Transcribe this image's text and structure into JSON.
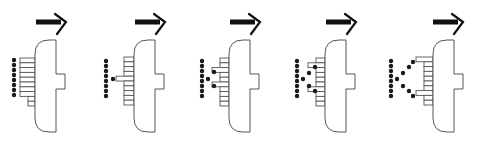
{
  "figure": {
    "colors": {
      "ink": "#111111",
      "outline": "#555555",
      "background": "#ffffff"
    },
    "common": {
      "body": {
        "top": 40,
        "bottom": 132,
        "width": 21,
        "corner_radius": 14,
        "knob": {
          "top": 74,
          "bottom": 89,
          "width": 9
        }
      },
      "arrow": {
        "y": 22,
        "length": 27,
        "shaft_thickness": 5
      },
      "dot_radius": 2.2,
      "rung_height": 4.8
    },
    "panels": [
      {
        "id": 1,
        "label": "I",
        "body_x": 35,
        "arrow_x": 36,
        "rungs": [
          {
            "y": 58,
            "x": 20
          },
          {
            "y": 62.8,
            "x": 20
          },
          {
            "y": 67.6,
            "x": 20
          },
          {
            "y": 72.4,
            "x": 20
          },
          {
            "y": 77.2,
            "x": 20
          },
          {
            "y": 82,
            "x": 20
          },
          {
            "y": 86.8,
            "x": 20
          },
          {
            "y": 91.6,
            "x": 20
          },
          {
            "y": 96.4,
            "x": 28
          },
          {
            "y": 101.2,
            "x": 28
          }
        ],
        "dots": [
          [
            14,
            60
          ],
          [
            14,
            65
          ],
          [
            14,
            70
          ],
          [
            14,
            75
          ],
          [
            14,
            80
          ],
          [
            14,
            85
          ],
          [
            14,
            90
          ],
          [
            14,
            95
          ]
        ]
      },
      {
        "id": 2,
        "label": "I with one branch dot",
        "body_x": 134,
        "arrow_x": 135,
        "rungs": [
          {
            "y": 57,
            "x": 124
          },
          {
            "y": 61.8,
            "x": 124
          },
          {
            "y": 66.6,
            "x": 124
          },
          {
            "y": 71.4,
            "x": 124
          },
          {
            "y": 76.2,
            "x": 116
          },
          {
            "y": 81,
            "x": 124
          },
          {
            "y": 85.8,
            "x": 124
          },
          {
            "y": 90.6,
            "x": 124
          },
          {
            "y": 95.4,
            "x": 124
          },
          {
            "y": 100.2,
            "x": 124
          }
        ],
        "dots": [
          [
            106,
            61
          ],
          [
            106,
            66
          ],
          [
            106,
            71
          ],
          [
            106,
            76
          ],
          [
            106,
            81
          ],
          [
            106,
            86
          ],
          [
            106,
            91
          ],
          [
            106,
            96
          ],
          [
            113,
            79
          ]
        ]
      },
      {
        "id": 3,
        "label": "I with two branch dots",
        "body_x": 229,
        "arrow_x": 230,
        "rungs": [
          {
            "y": 58,
            "x": 220
          },
          {
            "y": 62.8,
            "x": 220
          },
          {
            "y": 67.6,
            "x": 212
          },
          {
            "y": 72.4,
            "x": 220
          },
          {
            "y": 77.2,
            "x": 220
          },
          {
            "y": 82,
            "x": 212
          },
          {
            "y": 86.8,
            "x": 220
          },
          {
            "y": 91.6,
            "x": 220
          },
          {
            "y": 96.4,
            "x": 220
          },
          {
            "y": 101.2,
            "x": 220
          }
        ],
        "dots": [
          [
            202,
            61
          ],
          [
            202,
            66
          ],
          [
            202,
            71
          ],
          [
            202,
            76
          ],
          [
            202,
            81
          ],
          [
            202,
            86
          ],
          [
            202,
            91
          ],
          [
            202,
            96
          ],
          [
            208,
            79
          ],
          [
            214,
            72
          ],
          [
            214,
            86
          ]
        ]
      },
      {
        "id": 4,
        "label": "Partial K",
        "body_x": 325,
        "arrow_x": 326,
        "rungs": [
          {
            "y": 58,
            "x": 316
          },
          {
            "y": 62.8,
            "x": 308
          },
          {
            "y": 67.6,
            "x": 316
          },
          {
            "y": 72.4,
            "x": 316
          },
          {
            "y": 77.2,
            "x": 316
          },
          {
            "y": 82,
            "x": 316
          },
          {
            "y": 86.8,
            "x": 308
          },
          {
            "y": 91.6,
            "x": 316
          },
          {
            "y": 96.4,
            "x": 316
          },
          {
            "y": 101.2,
            "x": 316
          }
        ],
        "dots": [
          [
            297,
            61
          ],
          [
            297,
            66
          ],
          [
            297,
            71
          ],
          [
            297,
            76
          ],
          [
            297,
            81
          ],
          [
            297,
            86
          ],
          [
            297,
            91
          ],
          [
            297,
            96
          ],
          [
            303,
            79
          ],
          [
            309,
            73
          ],
          [
            309,
            86
          ],
          [
            315,
            67
          ],
          [
            315,
            91
          ]
        ]
      },
      {
        "id": 5,
        "label": "K",
        "body_x": 433,
        "arrow_x": 433,
        "rungs": [
          {
            "y": 57,
            "x": 416
          },
          {
            "y": 61.8,
            "x": 424
          },
          {
            "y": 66.6,
            "x": 424
          },
          {
            "y": 71.4,
            "x": 424
          },
          {
            "y": 76.2,
            "x": 424
          },
          {
            "y": 81,
            "x": 424
          },
          {
            "y": 85.8,
            "x": 424
          },
          {
            "y": 90.6,
            "x": 416
          },
          {
            "y": 95.4,
            "x": 424
          },
          {
            "y": 100.2,
            "x": 424
          }
        ],
        "dots": [
          [
            391,
            61
          ],
          [
            391,
            66
          ],
          [
            391,
            71
          ],
          [
            391,
            76
          ],
          [
            391,
            81
          ],
          [
            391,
            86
          ],
          [
            391,
            91
          ],
          [
            391,
            96
          ],
          [
            397,
            79
          ],
          [
            403,
            73
          ],
          [
            403,
            86
          ],
          [
            409,
            67
          ],
          [
            409,
            91
          ],
          [
            413,
            62
          ],
          [
            413,
            96
          ]
        ]
      }
    ]
  }
}
